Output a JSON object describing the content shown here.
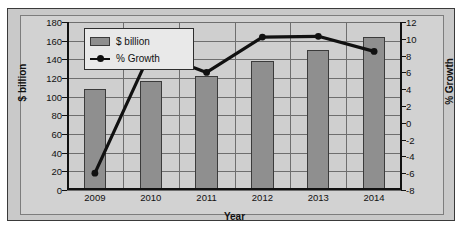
{
  "chart_data": {
    "type": "bar",
    "title": "",
    "categories": [
      "2009",
      "2010",
      "2011",
      "2012",
      "2013",
      "2014"
    ],
    "xlabel": "Year",
    "ylabel": "$ billion",
    "y2label": "% Growth",
    "ylim": [
      0,
      180
    ],
    "y2lim": [
      -8,
      12
    ],
    "yticks": [
      "0",
      "20",
      "40",
      "60",
      "80",
      "100",
      "120",
      "140",
      "160",
      "180"
    ],
    "y2ticks": [
      "-8",
      "-6",
      "-4",
      "-2",
      "0",
      "2",
      "4",
      "6",
      "8",
      "10",
      "12"
    ],
    "grid": true,
    "legend_position": "top-left",
    "series": [
      {
        "name": "$ billion",
        "type": "bar",
        "axis": "left",
        "color": "#8f8f8f",
        "values": [
          108,
          117,
          122,
          138,
          150,
          164
        ]
      },
      {
        "name": "% Growth",
        "type": "line",
        "axis": "right",
        "color": "#111111",
        "values": [
          -6.0,
          8.5,
          6.0,
          10.2,
          10.3,
          8.5
        ]
      }
    ]
  },
  "legend": {
    "items": [
      {
        "label": "$ billion",
        "marker": "bar-swatch-icon"
      },
      {
        "label": "% Growth",
        "marker": "line-marker-icon"
      }
    ]
  }
}
